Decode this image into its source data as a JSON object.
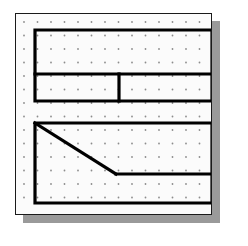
{
  "figure": {
    "title": "Geoboard dot-grid figure",
    "board": {
      "background_color": "#fbfbfb",
      "border_color": "#1a1a1a",
      "shadow_color": "#9a9a9a",
      "x": 15,
      "y": 13,
      "width": 197,
      "height": 202
    },
    "grid": {
      "type": "dot-array",
      "dot_color": "#8c8c8c",
      "dot_radius": 0.9,
      "spacing_x": 13.5,
      "spacing_y": 13.5,
      "origin_x": 8,
      "origin_y": 8,
      "columns": 14,
      "rows": 14
    },
    "stroke": {
      "color": "#000000",
      "width": 3.2
    },
    "shapes": [
      {
        "name": "upper-compound-rectangle",
        "description": "Large rectangle split by a horizontal line into an upper band and a lower band; the lower band is split by a vertical line into two cells.",
        "outline": [
          [
            19,
            16
          ],
          [
            196,
            16
          ],
          [
            196,
            87
          ],
          [
            19,
            87
          ]
        ],
        "dividers": [
          {
            "name": "horizontal-divider",
            "from": [
              19,
              60
            ],
            "to": [
              196,
              60
            ]
          },
          {
            "name": "vertical-divider",
            "from": [
              103,
              60
            ],
            "to": [
              103,
              87
            ]
          }
        ]
      },
      {
        "name": "lower-trapezoid-rectangle",
        "description": "Rectangle containing a diagonal from the top-left corner down to a vertex, then a horizontal segment running to the right edge.",
        "outline": [
          [
            19,
            109
          ],
          [
            196,
            109
          ],
          [
            196,
            189
          ],
          [
            19,
            189
          ]
        ],
        "dividers": [
          {
            "name": "diagonal-segment",
            "from": [
              19,
              109
            ],
            "to": [
              100,
              160
            ]
          },
          {
            "name": "horizontal-segment",
            "from": [
              100,
              160
            ],
            "to": [
              196,
              160
            ]
          }
        ]
      }
    ]
  }
}
